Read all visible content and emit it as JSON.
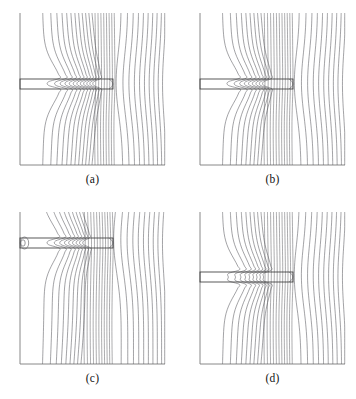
{
  "figure": {
    "type": "contour-plot-grid",
    "rows": 2,
    "cols": 2,
    "background_color": "#ffffff",
    "line_color": "#55555a",
    "frame_color": "#7a7a7a"
  },
  "panels": [
    {
      "id": "a",
      "caption": "(a)",
      "frame": {
        "x": 20,
        "y": 13,
        "w": 145,
        "h": 152
      },
      "slab": {
        "x": 20,
        "y": 79,
        "w": 93,
        "h": 10
      },
      "dense_band": {
        "x_start": 96,
        "x_end": 115
      },
      "has_left_loop": false
    },
    {
      "id": "b",
      "caption": "(b)",
      "frame": {
        "x": 200,
        "y": 13,
        "w": 145,
        "h": 152
      },
      "slab": {
        "x": 200,
        "y": 79,
        "w": 93,
        "h": 10
      },
      "dense_band": {
        "x_start": 265,
        "x_end": 293
      },
      "has_left_loop": false
    },
    {
      "id": "c",
      "caption": "(c)",
      "frame": {
        "x": 20,
        "y": 212,
        "w": 145,
        "h": 152
      },
      "slab": {
        "x": 20,
        "y": 238,
        "w": 93,
        "h": 10
      },
      "dense_band": {
        "x_start": 85,
        "x_end": 113
      },
      "has_left_loop": true
    },
    {
      "id": "d",
      "caption": "(d)",
      "frame": {
        "x": 200,
        "y": 212,
        "w": 145,
        "h": 152
      },
      "slab": {
        "x": 200,
        "y": 272,
        "w": 93,
        "h": 10
      },
      "dense_band": {
        "x_start": 265,
        "x_end": 293
      },
      "has_left_loop": false
    }
  ],
  "captions": {
    "a": "(a)",
    "b": "(b)",
    "c": "(c)",
    "d": "(d)"
  },
  "chart_data": {
    "type": "line",
    "title": "",
    "xlabel": "",
    "ylabel": "",
    "grid": false,
    "legend": "none",
    "series": [
      {
        "name": "panel-a-contours",
        "n_lines": 30,
        "dense_band_fraction": [
          0.52,
          0.66
        ],
        "slab_extent_fraction": [
          0.0,
          0.64
        ],
        "slab_vertical_center_fraction": 0.54
      },
      {
        "name": "panel-b-contours",
        "n_lines": 30,
        "dense_band_fraction": [
          0.45,
          0.64
        ],
        "slab_extent_fraction": [
          0.0,
          0.64
        ],
        "slab_vertical_center_fraction": 0.54
      },
      {
        "name": "panel-c-contours",
        "n_lines": 30,
        "dense_band_fraction": [
          0.45,
          0.64
        ],
        "slab_extent_fraction": [
          0.0,
          0.64
        ],
        "slab_vertical_center_fraction": 0.18
      },
      {
        "name": "panel-d-contours",
        "n_lines": 30,
        "dense_band_fraction": [
          0.45,
          0.64
        ],
        "slab_extent_fraction": [
          0.0,
          0.64
        ],
        "slab_vertical_center_fraction": 0.4
      }
    ]
  }
}
